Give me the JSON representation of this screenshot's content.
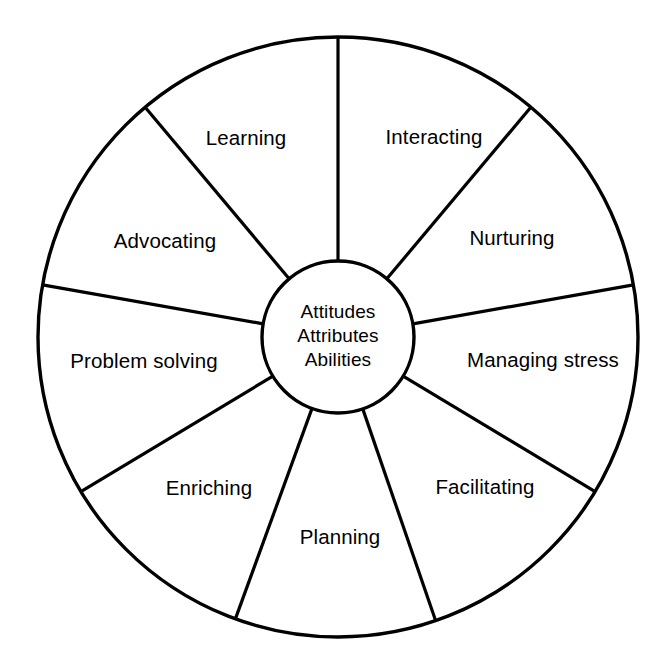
{
  "diagram": {
    "type": "segmented-wheel",
    "title_visible": false,
    "colors": {
      "stroke": "#000000",
      "background": "#ffffff",
      "text": "#000000"
    },
    "geometry": {
      "center_x": 338,
      "center_y": 337,
      "outer_radius": 300,
      "hub_radius": 76
    },
    "hub": {
      "name": "core-attributes",
      "lines": [
        "Attitudes",
        "Attributes",
        "Abilities"
      ]
    },
    "segments": [
      {
        "id": "interacting",
        "label": "Interacting",
        "label_x": 434,
        "label_y": 139,
        "start_angle": -90,
        "end_angle": -50
      },
      {
        "id": "nurturing",
        "label": "Nurturing",
        "label_x": 512,
        "label_y": 240,
        "start_angle": -50,
        "end_angle": -10
      },
      {
        "id": "managing-stress",
        "label": "Managing stress",
        "label_x": 543,
        "label_y": 362,
        "start_angle": -10,
        "end_angle": 31
      },
      {
        "id": "facilitating",
        "label": "Facilitating",
        "label_x": 485,
        "label_y": 489,
        "start_angle": 31,
        "end_angle": 71
      },
      {
        "id": "planning",
        "label": "Planning",
        "label_x": 340,
        "label_y": 539,
        "start_angle": 71,
        "end_angle": 110
      },
      {
        "id": "enriching",
        "label": "Enriching",
        "label_x": 209,
        "label_y": 490,
        "start_angle": 110,
        "end_angle": 149
      },
      {
        "id": "problem-solving",
        "label": "Problem solving",
        "label_x": 144,
        "label_y": 363,
        "start_angle": 149,
        "end_angle": 190
      },
      {
        "id": "advocating",
        "label": "Advocating",
        "label_x": 165,
        "label_y": 243,
        "start_angle": 190,
        "end_angle": 230
      },
      {
        "id": "learning",
        "label": "Learning",
        "label_x": 246,
        "label_y": 140,
        "start_angle": 230,
        "end_angle": 270
      }
    ],
    "spoke_angles_deg": [
      -90,
      -50,
      -10,
      31,
      71,
      110,
      149,
      190,
      230
    ]
  }
}
